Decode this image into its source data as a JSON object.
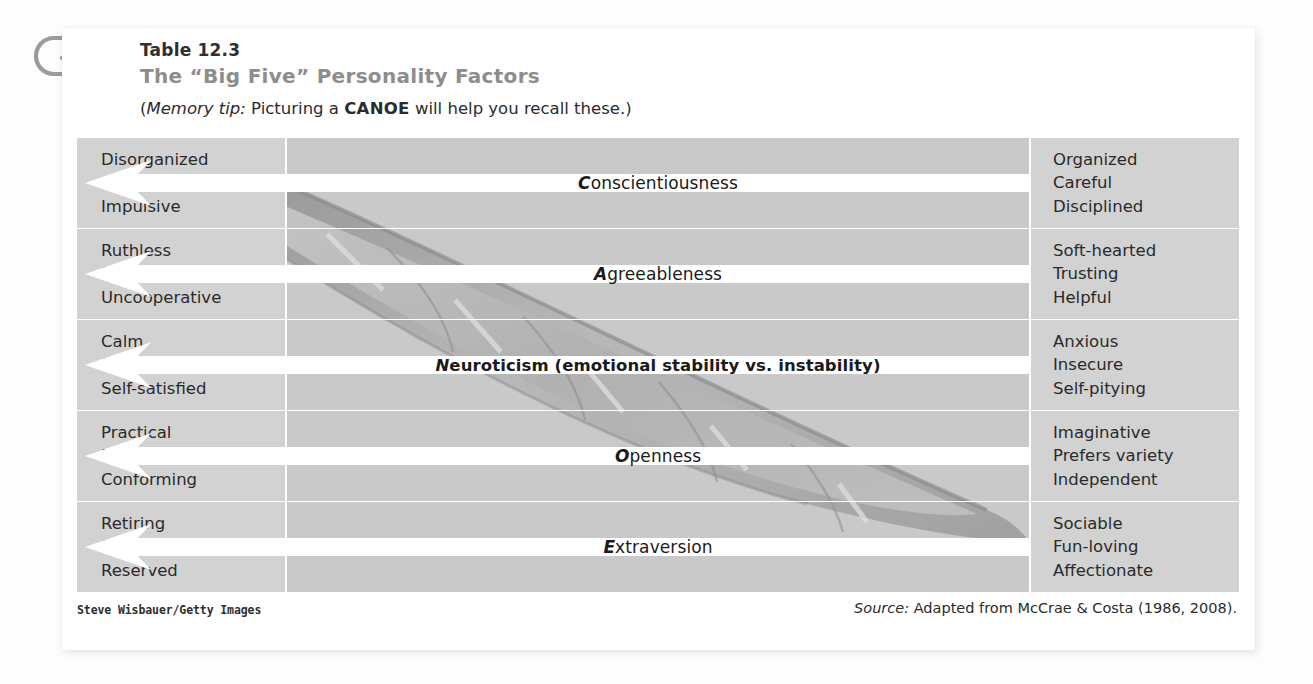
{
  "header": {
    "table_number": "Table 12.3",
    "title": "The “Big Five” Personality Factors",
    "memo_open": "(",
    "memo_italic": "Memory tip:",
    "memo_before": " Picturing a ",
    "memo_bold": "CANOE",
    "memo_after": " will help you recall these.)"
  },
  "icons": {
    "paperclip": "paperclip-icon"
  },
  "colors": {
    "cell_side": "#d2d2d2",
    "cell_mid": "#c9c9c9",
    "arrow": "#ffffff",
    "title_gray": "#8d8d8d",
    "text_dark": "#2a2a2a",
    "card": "#ffffff",
    "page": "#fdfdfd"
  },
  "table": {
    "rows": [
      {
        "factor": "Conscientiousness",
        "lead_letter": "C",
        "rest": "onscientiousness",
        "bold": false,
        "low_traits": [
          "Disorganized",
          "Careless",
          "Impulsive"
        ],
        "high_traits": [
          "Organized",
          "Careful",
          "Disciplined"
        ]
      },
      {
        "factor": "Agreeableness",
        "lead_letter": "A",
        "rest": "greeableness",
        "bold": false,
        "low_traits": [
          "Ruthless",
          "Suspicious",
          "Uncooperative"
        ],
        "high_traits": [
          "Soft-hearted",
          "Trusting",
          "Helpful"
        ]
      },
      {
        "factor": "Neuroticism (emotional stability vs. instability)",
        "lead_letter": "N",
        "rest": "euroticism (emotional stability vs. instability)",
        "bold": true,
        "low_traits": [
          "Calm",
          "Secure",
          "Self-satisfied"
        ],
        "high_traits": [
          "Anxious",
          "Insecure",
          "Self-pitying"
        ]
      },
      {
        "factor": "Openness",
        "lead_letter": "O",
        "rest": "penness",
        "bold": false,
        "low_traits": [
          "Practical",
          "Prefers routine",
          "Conforming"
        ],
        "high_traits": [
          "Imaginative",
          "Prefers variety",
          "Independent"
        ]
      },
      {
        "factor": "Extraversion",
        "lead_letter": "E",
        "rest": "xtraversion",
        "bold": false,
        "low_traits": [
          "Retiring",
          "Sober",
          "Reserved"
        ],
        "high_traits": [
          "Sociable",
          "Fun-loving",
          "Affectionate"
        ]
      }
    ]
  },
  "footer": {
    "credit": "Steve Wisbauer/Getty Images",
    "source_label": "Source:",
    "source_text": " Adapted from McCrae & Costa (1986, 2008)."
  }
}
